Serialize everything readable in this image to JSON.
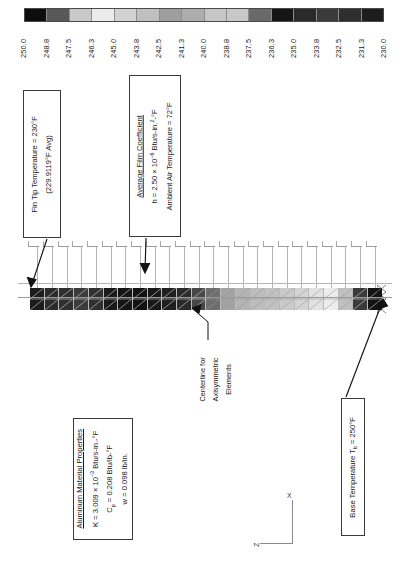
{
  "figure": {
    "type": "fea-thermal-contour",
    "orientation": "rotated-90-ccw",
    "title_visible": false
  },
  "legend": {
    "name": "temperature-contour-legend",
    "unit": "°F",
    "tick_labels": [
      "250.0",
      "248.8",
      "247.5",
      "246.3",
      "245.0",
      "243.8",
      "242.5",
      "241.3",
      "240.0",
      "238.8",
      "237.5",
      "236.3",
      "235.0",
      "233.8",
      "232.5",
      "231.3",
      "230.0"
    ],
    "band_colors": [
      "#0d0d0d",
      "#585858",
      "#c9c9c9",
      "#ebebeb",
      "#d2d2d2",
      "#c0c0c0",
      "#9e9e9e",
      "#adadad",
      "#c6c6c6",
      "#c8c8c8",
      "#6a6a6a",
      "#151515",
      "#2a2a2a",
      "#3a3a3a",
      "#2e2e2e",
      "#1d1d1d"
    ],
    "band_count": 16
  },
  "chart_data": {
    "type": "heatmap",
    "xlabel": "",
    "ylabel": "",
    "colorbar_label": "Temperature (°F)",
    "colorbar_ticks": [
      250.0,
      248.8,
      247.5,
      246.3,
      245.0,
      243.8,
      242.5,
      241.3,
      240.0,
      238.8,
      237.5,
      236.3,
      235.0,
      233.8,
      232.5,
      231.3,
      230.0
    ],
    "clim": [
      230.0,
      250.0
    ],
    "grid": false,
    "legend_position": "top",
    "element_count": 24,
    "element_temperatures": [
      230.0,
      230.6,
      231.3,
      232.0,
      232.8,
      233.6,
      234.5,
      235.4,
      236.3,
      237.3,
      238.3,
      239.3,
      240.4,
      241.5,
      242.6,
      243.7,
      244.8,
      245.8,
      246.8,
      247.6,
      248.3,
      248.9,
      249.5,
      250.0
    ],
    "element_fill_colors": [
      "#1b1b1b",
      "#2b2b2b",
      "#2f2f2f",
      "#3b3b3b",
      "#303030",
      "#1a1a1a",
      "#141414",
      "#121212",
      "#181818",
      "#1f1f1f",
      "#2a2a2a",
      "#474747",
      "#6e6e6e",
      "#a3a3a3",
      "#b4b4b4",
      "#bdbdbd",
      "#c2c2c2",
      "#cacaca",
      "#d4d4d4",
      "#e2e2e2",
      "#ededed",
      "#c0c0c0",
      "#3a3a3a",
      "#121212"
    ]
  },
  "annotations": {
    "fin_tip": {
      "name": "fin-tip-temperature-callout",
      "line1": "Fin Tip Temperature = 230°F",
      "line2": "(229.9119°F Avg)"
    },
    "film_coefficient": {
      "name": "film-coefficient-callout",
      "heading": "Average Film Coefficient",
      "h_prefix": "h = 2.50 × 10",
      "h_exp": "−6",
      "h_suffix": " Btu/s-in.",
      "h_suffix_exp": "2",
      "h_suffix_tail": "-°F",
      "ambient": "Ambient Air Temperature = 72°F"
    },
    "material": {
      "name": "aluminum-material-properties-callout",
      "heading": "Aluminum Material Properties",
      "k_prefix": "K = 3.009 × 10",
      "k_exp": "−3",
      "k_suffix": " Btu/s-in.-°F",
      "cp_prefix": "C",
      "cp_sub": "p",
      "cp_suffix": " = 0.208 Btu/lb-°F",
      "w": "w = 0.098 lb/in."
    },
    "base_temperature": {
      "name": "base-temperature-callout",
      "prefix": "Base Temperature T",
      "sub": "b",
      "suffix": " = 250°F"
    },
    "centerline": {
      "name": "centerline-label",
      "line1": "Centerline for",
      "line2": "Axisymmetric",
      "line3": "Elements"
    }
  },
  "axes_triad": {
    "name": "coordinate-triad",
    "x_label": "X",
    "z_label": "Z"
  },
  "colors": {
    "ink": "#1a1a1a",
    "mesh_line": "#b9b9b9",
    "leader": "#111111",
    "box_border": "#3a3a3a"
  }
}
